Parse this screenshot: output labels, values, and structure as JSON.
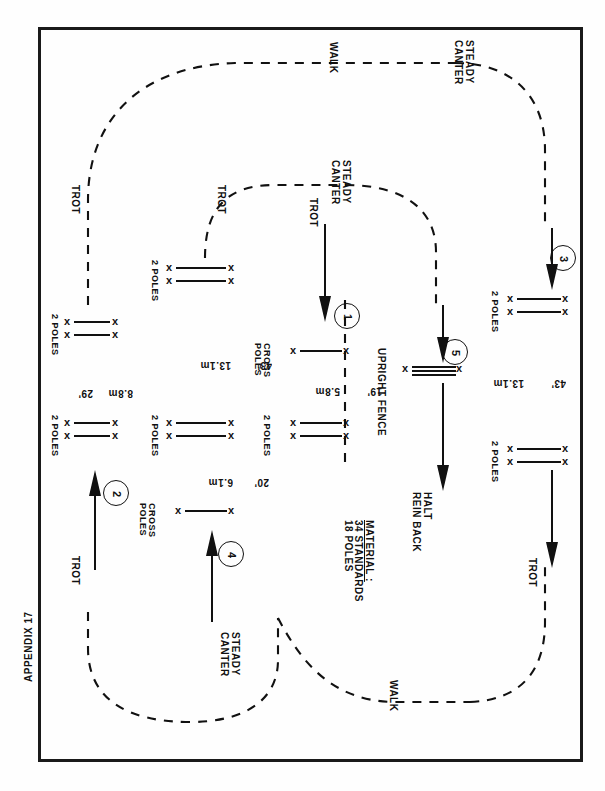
{
  "document": {
    "appendix_label": "APPENDIX 17",
    "page_marker": ""
  },
  "diagram": {
    "material": {
      "heading": "MATERIAL :",
      "lines": [
        "34  STANDARDS",
        "18  POLES"
      ]
    },
    "gaits": {
      "walk_1": "WALK",
      "walk_2": "WALK",
      "trot_outer": "TROT",
      "trot_inner": "TROT",
      "trot_center": "TROT",
      "trot_left_lower": "TROT",
      "trot_right_lower": "TROT",
      "steady_canter_1": "STEADY\nCANTER",
      "steady_canter_2": "STEADY\nCANTER",
      "steady_canter_3": "STEADY\nCANTER"
    },
    "gait_labels": [
      {
        "id": "walk-top",
        "text": "WALK"
      },
      {
        "id": "steady-canter-top-right",
        "text": "STEADY CANTER"
      },
      {
        "id": "trot-left-outer",
        "text": "TROT"
      },
      {
        "id": "trot-inner-upper",
        "text": "TROT"
      },
      {
        "id": "trot-center",
        "text": "TROT"
      },
      {
        "id": "steady-canter-center",
        "text": "STEADY CANTER"
      },
      {
        "id": "trot-left-lower",
        "text": "TROT"
      },
      {
        "id": "steady-canter-bottom",
        "text": "STEADY CANTER"
      },
      {
        "id": "walk-bottom",
        "text": "WALK"
      },
      {
        "id": "trot-right-lower",
        "text": "TROT"
      },
      {
        "id": "halt-rein-back",
        "text": "HALT REIN BACK"
      }
    ],
    "halt": {
      "line1": "HALT",
      "line2": "REIN BACK"
    },
    "steps": [
      {
        "number": "1"
      },
      {
        "number": "2"
      },
      {
        "number": "3"
      },
      {
        "number": "4"
      },
      {
        "number": "5"
      }
    ],
    "obstacles": [
      {
        "id": "o-left-a",
        "label": "2 POLES",
        "poles": 2
      },
      {
        "id": "o-left-b",
        "label": "2 POLES",
        "poles": 2
      },
      {
        "id": "o-mid-a",
        "label": "2 POLES",
        "poles": 2
      },
      {
        "id": "o-mid-b",
        "label": "2 POLES",
        "poles": 2
      },
      {
        "id": "o-cross-a",
        "label": "CROSS POLES",
        "poles": 1
      },
      {
        "id": "o-cross-b",
        "label": "CROSS POLES",
        "poles": 1
      },
      {
        "id": "o-ctr-a",
        "label": "2 POLES",
        "poles": 2
      },
      {
        "id": "o-upright",
        "label": "UPRIGHT FENCE",
        "poles": 3
      },
      {
        "id": "o-right-a",
        "label": "2 POLES",
        "poles": 2
      },
      {
        "id": "o-right-b",
        "label": "2 POLES",
        "poles": 2
      }
    ],
    "dimensions": [
      {
        "id": "d-8-8m",
        "metric": "8.8m",
        "imperial": "29'"
      },
      {
        "id": "d-13-1m",
        "metric": "13.1m",
        "imperial": "43'"
      },
      {
        "id": "d-5-8m",
        "metric": "5.8m",
        "imperial": "19'"
      },
      {
        "id": "d-6-1m",
        "metric": "6.1m",
        "imperial": "20'"
      },
      {
        "id": "d-13-1m-right",
        "metric": "13.1m",
        "imperial": "43'"
      }
    ],
    "colors": {
      "ink": "#111111",
      "paper": "#fefefe",
      "frame": "#1a1a1a"
    }
  }
}
